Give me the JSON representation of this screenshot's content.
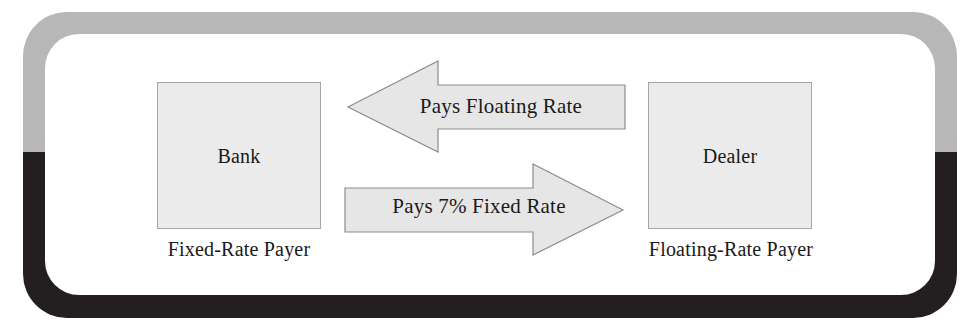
{
  "figure": {
    "type": "interest-rate-swap-diagram",
    "frame": {
      "top_band_color": "#b7b7b7",
      "bottom_band_color": "#231f20",
      "inner_color": "#ffffff"
    },
    "node_fill": "#ebebeb",
    "node_stroke": "#a6a6a6",
    "arrow_fill": "#e6e6e6",
    "arrow_stroke": "#8c8c8c",
    "text_color": "#1a1a1a"
  },
  "nodes": [
    {
      "id": "bank",
      "label": "Bank",
      "caption": "Fixed-Rate Payer"
    },
    {
      "id": "dealer",
      "label": "Dealer",
      "caption": "Floating-Rate Payer"
    }
  ],
  "flows": [
    {
      "id": "floating-leg",
      "label": "Pays Floating Rate",
      "from": "dealer",
      "to": "bank",
      "direction": "left"
    },
    {
      "id": "fixed-leg",
      "label": "Pays 7% Fixed Rate",
      "from": "bank",
      "to": "dealer",
      "direction": "right",
      "rate": "7%"
    }
  ]
}
